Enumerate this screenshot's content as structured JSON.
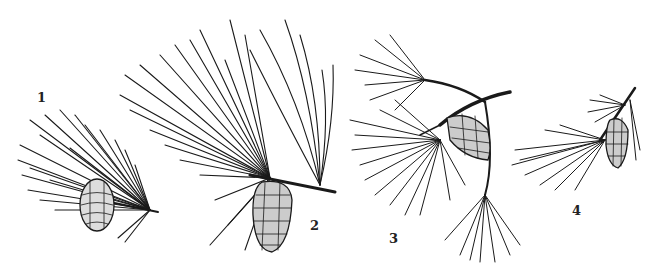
{
  "figure": {
    "background": "#ffffff",
    "ink": "#1a1a1a",
    "specimens": [
      {
        "label": "1",
        "label_pos": [
          37,
          97
        ]
      },
      {
        "label": "2",
        "label_pos": [
          310,
          225
        ]
      },
      {
        "label": "3",
        "label_pos": [
          389,
          238
        ]
      },
      {
        "label": "4",
        "label_pos": [
          572,
          210
        ]
      }
    ]
  }
}
